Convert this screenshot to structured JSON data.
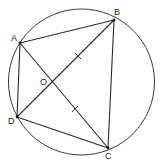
{
  "diagram": {
    "type": "geometry",
    "circle": {
      "cx": 81.5,
      "cy": 82,
      "r": 73
    },
    "points": {
      "A": {
        "label": "A",
        "x": 20,
        "y": 43,
        "label_x": 11,
        "label_y": 41
      },
      "B": {
        "label": "B",
        "x": 114,
        "y": 20,
        "label_x": 114,
        "label_y": 15
      },
      "C": {
        "label": "C",
        "x": 108,
        "y": 148,
        "label_x": 105,
        "label_y": 159
      },
      "D": {
        "label": "D",
        "x": 17,
        "y": 117,
        "label_x": 8,
        "label_y": 124
      },
      "O": {
        "label": "O",
        "x": 51,
        "y": 82,
        "label_x": 40,
        "label_y": 85
      }
    },
    "segments": [
      {
        "name": "AB",
        "from": "A",
        "to": "B"
      },
      {
        "name": "BC",
        "from": "B",
        "to": "C"
      },
      {
        "name": "CD",
        "from": "C",
        "to": "D"
      },
      {
        "name": "DA",
        "from": "D",
        "to": "A"
      },
      {
        "name": "AC",
        "from": "A",
        "to": "C"
      },
      {
        "name": "BD",
        "from": "B",
        "to": "D"
      }
    ],
    "equal_marks": [
      {
        "segment": "OB",
        "x": 78,
        "y": 56
      },
      {
        "segment": "OC",
        "x": 75,
        "y": 109
      }
    ],
    "colors": {
      "stroke": "#2a2a2a",
      "background": "#ffffff"
    }
  }
}
